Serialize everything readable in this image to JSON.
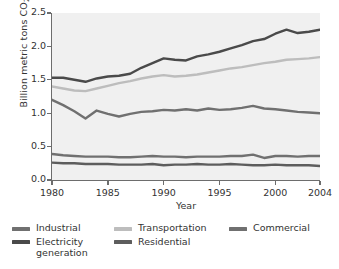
{
  "chart_data": {
    "type": "line",
    "title": "",
    "xlabel": "Year",
    "ylabel": "Billion metric tons CO2",
    "ylabel_display": "Billion metric tons CO",
    "ylabel_sub": "2",
    "xlim": [
      1980,
      2004
    ],
    "ylim": [
      0.0,
      2.5
    ],
    "ytick_labels": [
      "0.0",
      "0.5",
      "1.0",
      "1.5",
      "2.0",
      "2.5"
    ],
    "ytick_values": [
      0.0,
      0.5,
      1.0,
      1.5,
      2.0,
      2.5
    ],
    "xtick_labels": [
      "1980",
      "1985",
      "1990",
      "1995",
      "2000",
      "2004"
    ],
    "xtick_values": [
      1980,
      1985,
      1990,
      1995,
      2000,
      2004
    ],
    "grid": false,
    "legend_position": "below",
    "plot_background": "#f0f0f0",
    "axis_color": "#6d6d6d",
    "x": [
      1980,
      1981,
      1982,
      1983,
      1984,
      1985,
      1986,
      1987,
      1988,
      1989,
      1990,
      1991,
      1992,
      1993,
      1994,
      1995,
      1996,
      1997,
      1998,
      1999,
      2000,
      2001,
      2002,
      2003,
      2004
    ],
    "series": [
      {
        "name": "Electricity generation",
        "color": "#4a4a4a",
        "values": [
          1.53,
          1.53,
          1.5,
          1.47,
          1.52,
          1.55,
          1.56,
          1.59,
          1.68,
          1.75,
          1.82,
          1.8,
          1.79,
          1.85,
          1.88,
          1.92,
          1.97,
          2.02,
          2.08,
          2.11,
          2.19,
          2.25,
          2.2,
          2.22,
          2.25
        ]
      },
      {
        "name": "Transportation",
        "color": "#bdbdbd",
        "values": [
          1.4,
          1.37,
          1.34,
          1.33,
          1.37,
          1.41,
          1.45,
          1.48,
          1.52,
          1.55,
          1.57,
          1.55,
          1.56,
          1.58,
          1.61,
          1.64,
          1.67,
          1.69,
          1.72,
          1.75,
          1.77,
          1.8,
          1.81,
          1.82,
          1.84
        ]
      },
      {
        "name": "Industrial",
        "color": "#707070",
        "values": [
          1.2,
          1.12,
          1.03,
          0.92,
          1.04,
          0.99,
          0.95,
          0.99,
          1.02,
          1.03,
          1.05,
          1.04,
          1.06,
          1.04,
          1.07,
          1.05,
          1.06,
          1.08,
          1.11,
          1.07,
          1.06,
          1.04,
          1.02,
          1.01,
          1.0
        ]
      },
      {
        "name": "Commercial",
        "color": "#707070",
        "values": [
          0.39,
          0.37,
          0.36,
          0.35,
          0.35,
          0.35,
          0.34,
          0.34,
          0.35,
          0.36,
          0.35,
          0.35,
          0.34,
          0.35,
          0.35,
          0.35,
          0.36,
          0.36,
          0.38,
          0.33,
          0.36,
          0.36,
          0.35,
          0.36,
          0.36
        ]
      },
      {
        "name": "Residential",
        "color": "#5d5d5d",
        "values": [
          0.26,
          0.25,
          0.25,
          0.24,
          0.24,
          0.24,
          0.23,
          0.23,
          0.23,
          0.24,
          0.22,
          0.23,
          0.23,
          0.24,
          0.23,
          0.23,
          0.24,
          0.23,
          0.22,
          0.22,
          0.23,
          0.22,
          0.22,
          0.22,
          0.21
        ]
      }
    ]
  },
  "legend": {
    "items": [
      {
        "label": "Industrial",
        "color": "#707070"
      },
      {
        "label": "Transportation",
        "color": "#bdbdbd"
      },
      {
        "label": "Commercial",
        "color": "#707070"
      },
      {
        "label": "Electricity generation",
        "color": "#4a4a4a"
      },
      {
        "label": "Residential",
        "color": "#5d5d5d"
      }
    ]
  }
}
